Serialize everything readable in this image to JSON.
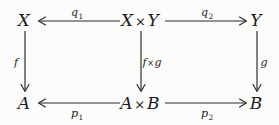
{
  "diagram": {
    "type": "commutative-diagram",
    "background_color": "#fbfbf9",
    "ink_color": "#2b2b2b",
    "nodes": [
      {
        "id": "X",
        "label": "X",
        "row": "top",
        "column": "left",
        "x": 24,
        "y": 20
      },
      {
        "id": "XxY",
        "label": "X",
        "label2": "Y",
        "times": "×",
        "row": "top",
        "column": "center",
        "x": 140,
        "y": 20
      },
      {
        "id": "Y",
        "label": "Y",
        "row": "top",
        "column": "right",
        "x": 256,
        "y": 20
      },
      {
        "id": "A",
        "label": "A",
        "row": "bottom",
        "column": "left",
        "x": 24,
        "y": 103
      },
      {
        "id": "AxB",
        "label": "A",
        "label2": "B",
        "times": "×",
        "row": "bottom",
        "column": "center",
        "x": 140,
        "y": 103
      },
      {
        "id": "B",
        "label": "B",
        "row": "bottom",
        "column": "right",
        "x": 256,
        "y": 103
      }
    ],
    "arrows": [
      {
        "id": "q1",
        "label": "q",
        "subscript": "1",
        "from": "XxY",
        "to": "X",
        "direction": "left",
        "orientation": "horizontal",
        "label_position": "above",
        "label_x": 77,
        "label_y": 12
      },
      {
        "id": "q2",
        "label": "q",
        "subscript": "2",
        "from": "XxY",
        "to": "Y",
        "direction": "right",
        "orientation": "horizontal",
        "label_position": "above",
        "label_x": 207,
        "label_y": 12
      },
      {
        "id": "p1",
        "label": "p",
        "subscript": "1",
        "from": "AxB",
        "to": "A",
        "direction": "left",
        "orientation": "horizontal",
        "label_position": "below",
        "label_x": 77,
        "label_y": 113
      },
      {
        "id": "p2",
        "label": "p",
        "subscript": "2",
        "from": "AxB",
        "to": "B",
        "direction": "right",
        "orientation": "horizontal",
        "label_position": "below",
        "label_x": 207,
        "label_y": 113
      },
      {
        "id": "f",
        "label": "f",
        "subscript": "",
        "from": "X",
        "to": "A",
        "direction": "down",
        "orientation": "vertical",
        "label_position": "left",
        "label_x": 16,
        "label_y": 62
      },
      {
        "id": "fxg",
        "label": "f",
        "label2": "g",
        "times": "×",
        "subscript": "",
        "from": "XxY",
        "to": "AxB",
        "direction": "down",
        "orientation": "vertical",
        "label_position": "right",
        "label_x": 152,
        "label_y": 62
      },
      {
        "id": "g",
        "label": "g",
        "subscript": "",
        "from": "Y",
        "to": "B",
        "direction": "down",
        "orientation": "vertical",
        "label_position": "right",
        "label_x": 264,
        "label_y": 62
      }
    ]
  }
}
